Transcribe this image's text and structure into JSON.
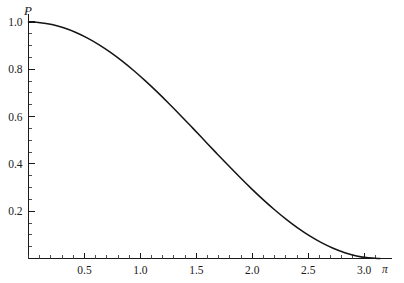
{
  "chart_data": {
    "type": "line",
    "title": "",
    "subtitle": "",
    "xlabel": "",
    "ylabel": "P",
    "xlim": [
      0,
      3.14159265
    ],
    "ylim": [
      0,
      1.0
    ],
    "grid": false,
    "legend": null,
    "function": "P(x) = cos^2(x/2) = (1 + cos x)/2",
    "x_tick_labels": [
      "0.5",
      "1.0",
      "1.5",
      "2.0",
      "2.5",
      "3.0"
    ],
    "x_tick_values": [
      0.5,
      1.0,
      1.5,
      2.0,
      2.5,
      3.0
    ],
    "x_end_label": "π",
    "x_minor_step": 0.1,
    "y_tick_labels": [
      "0.2",
      "0.4",
      "0.6",
      "0.8",
      "1.0"
    ],
    "y_tick_values": [
      0.2,
      0.4,
      0.6,
      0.8,
      1.0
    ],
    "y_minor_step": 0.05,
    "series": [
      {
        "name": "P",
        "color": "#141414",
        "x": [
          0.0,
          0.10471976,
          0.20943951,
          0.31415927,
          0.41887902,
          0.52359878,
          0.62831853,
          0.73303829,
          0.83775804,
          0.9424778,
          1.04719755,
          1.15191731,
          1.25663706,
          1.36135682,
          1.46607657,
          1.57079633,
          1.67551608,
          1.78023584,
          1.88495559,
          1.98967535,
          2.0943951,
          2.19911486,
          2.30383461,
          2.40855437,
          2.51327412,
          2.61799388,
          2.72271363,
          2.82743339,
          2.93215314,
          3.0368729,
          3.14159265
        ],
        "values": [
          1.0,
          0.99726095,
          0.9890738,
          0.97552826,
          0.95677273,
          0.9330127,
          0.9045085,
          0.87157241,
          0.8345653,
          0.79389263,
          0.75,
          0.70336832,
          0.6545085,
          0.60395585,
          0.55226423,
          0.5,
          0.44773577,
          0.39604415,
          0.3454915,
          0.29663168,
          0.25,
          0.20610737,
          0.1654347,
          0.12842759,
          0.0954915,
          0.0669873,
          0.04322727,
          0.02447174,
          0.0109262,
          0.00273905,
          0.0
        ]
      }
    ]
  },
  "figure": {
    "y_axis_title": "P",
    "pi_symbol": "π"
  }
}
